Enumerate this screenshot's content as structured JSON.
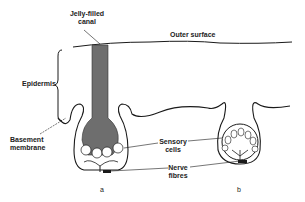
{
  "diagram": {
    "labels": {
      "jelly_filled_canal": [
        "Jelly-filled",
        "canal"
      ],
      "outer_surface": "Outer surface",
      "epidermis": "Epidermis",
      "basement_membrane": [
        "Basement",
        "membrane"
      ],
      "sensory_cells": [
        "Sensory",
        "cells"
      ],
      "nerve_fibres": [
        "Nerve",
        "fibres"
      ]
    },
    "panels": [
      {
        "id": "a",
        "label": "a"
      },
      {
        "id": "b",
        "label": "b"
      }
    ],
    "colors": {
      "line": "#1a1a1a",
      "canal_fill": "#6e6e6e",
      "background": "#ffffff"
    }
  }
}
